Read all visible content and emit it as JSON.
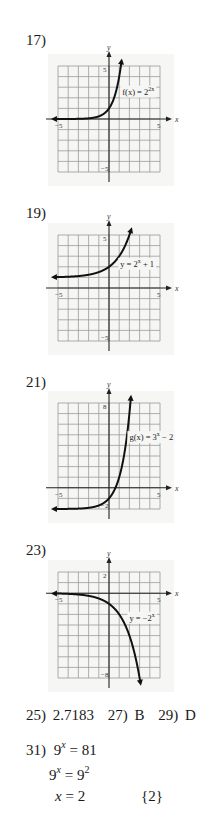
{
  "problems": [
    {
      "label": "17)",
      "graph": {
        "function_label": "f(x) = 2^{2x}",
        "label_parts": {
          "prefix": "f(x) = 2",
          "exp": "2x"
        },
        "x_ticks": {
          "min": "-5",
          "max": "5"
        },
        "y_ticks": {
          "top": "5",
          "bottom": "-5"
        },
        "x_axis_letter": "x",
        "y_axis_letter": "y"
      }
    },
    {
      "label": "19)",
      "graph": {
        "function_label": "y = 2^x + 1",
        "label_parts": {
          "prefix": "y = 2",
          "exp": "x",
          "suffix": " + 1"
        },
        "x_ticks": {
          "min": "-5",
          "max": "5"
        },
        "y_ticks": {
          "top": "5",
          "bottom": "-5"
        },
        "x_axis_letter": "x",
        "y_axis_letter": "y"
      }
    },
    {
      "label": "21)",
      "graph": {
        "function_label": "g(x) = 3^x - 2",
        "label_parts": {
          "prefix": "g(x) = 3",
          "exp": "x",
          "suffix": " − 2"
        },
        "x_ticks": {
          "min": "-5",
          "max": "5"
        },
        "y_ticks": {
          "top": "8",
          "bottom": "-2"
        },
        "x_axis_letter": "x",
        "y_axis_letter": "y"
      }
    },
    {
      "label": "23)",
      "graph": {
        "function_label": "y = -2^x",
        "label_parts": {
          "prefix": "y = −2",
          "exp": "x"
        },
        "x_ticks": {
          "min": "-5",
          "max": "5"
        },
        "y_ticks": {
          "top": "2",
          "bottom": "-8"
        },
        "x_axis_letter": "x",
        "y_axis_letter": "y"
      }
    }
  ],
  "short_answers": [
    {
      "label": "25)",
      "value": "2.7183"
    },
    {
      "label": "27)",
      "value": "B"
    },
    {
      "label": "29)",
      "value": "D"
    }
  ],
  "problem31": {
    "label": "31)",
    "line1": {
      "base": "9",
      "exp": "x",
      "rhs": " = 81"
    },
    "line2": {
      "base": "9",
      "exp": "x",
      "rhs_base": " = 9",
      "rhs_exp": "2"
    },
    "line3": {
      "var": "x",
      "rhs": " = 2"
    },
    "solution_set": "{2}"
  }
}
